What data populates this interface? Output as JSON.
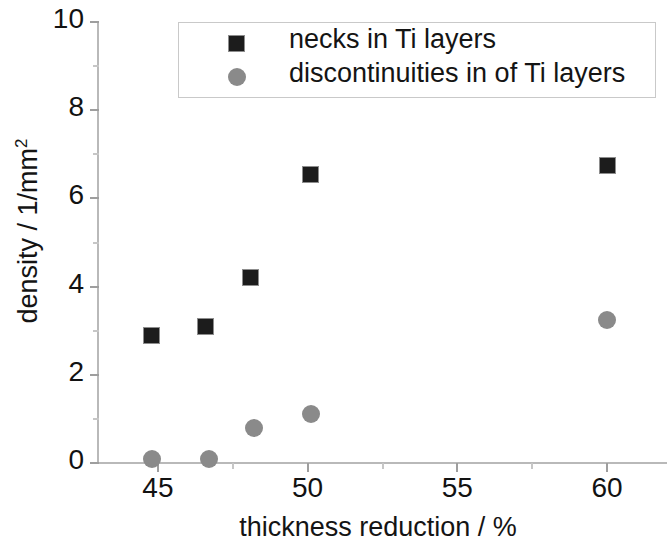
{
  "chart_data": {
    "type": "scatter",
    "title": "",
    "xlabel": "thickness reduction / %",
    "ylabel": "density / 1/mm",
    "ylabel_sup": "2",
    "ylabel_full": "density / 1/mm2",
    "xlim": [
      43,
      62
    ],
    "ylim": [
      0,
      10
    ],
    "xticks": [
      45,
      50,
      55,
      60
    ],
    "xtick_labels": [
      "45",
      "50",
      "55",
      "60"
    ],
    "xticks_minor": [
      47.5,
      52.5,
      57.5
    ],
    "yticks": [
      0,
      2,
      4,
      6,
      8,
      10
    ],
    "ytick_labels": [
      "0",
      "2",
      "4",
      "6",
      "8",
      "10"
    ],
    "yticks_minor": [
      1,
      3,
      5,
      7,
      9
    ],
    "grid": false,
    "legend_position": "top-right",
    "series": [
      {
        "name": "necks in Ti layers",
        "marker": "square",
        "color": "#1c1c1c",
        "points": [
          {
            "x": 44.8,
            "y": 2.9
          },
          {
            "x": 46.6,
            "y": 3.1
          },
          {
            "x": 48.1,
            "y": 4.2
          },
          {
            "x": 50.1,
            "y": 6.55
          },
          {
            "x": 60.0,
            "y": 6.75
          }
        ]
      },
      {
        "name": "discontinuities in of Ti layers",
        "marker": "circle",
        "color": "#8a8a8a",
        "points": [
          {
            "x": 44.8,
            "y": 0.1
          },
          {
            "x": 46.7,
            "y": 0.1
          },
          {
            "x": 48.2,
            "y": 0.8
          },
          {
            "x": 50.1,
            "y": 1.1
          },
          {
            "x": 60.0,
            "y": 3.25
          }
        ]
      }
    ]
  },
  "legend": {
    "entries": [
      {
        "label": "necks in Ti layers",
        "marker": "square-marker-icon"
      },
      {
        "label": "discontinuities in of Ti layers",
        "marker": "circle-marker-icon"
      }
    ]
  },
  "axes": {
    "x_title": "thickness reduction / %",
    "y_title_main": "density / 1/mm",
    "y_title_sup": "2"
  }
}
